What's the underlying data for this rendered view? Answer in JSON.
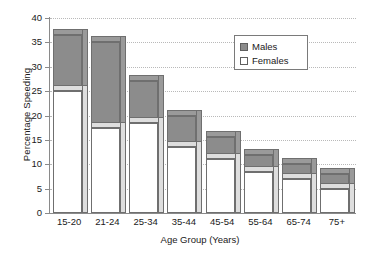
{
  "chart_data": {
    "type": "bar",
    "title": "",
    "xlabel": "Age Group (Years)",
    "ylabel": "Percentage Speeding",
    "categories": [
      "15-20",
      "21-24",
      "25-34",
      "35-44",
      "45-54",
      "55-64",
      "65-74",
      "75+"
    ],
    "series": [
      {
        "name": "Males",
        "values": [
          36.5,
          35.0,
          27.0,
          20.0,
          15.5,
          12.0,
          10.0,
          8.0
        ]
      },
      {
        "name": "Females",
        "values": [
          25.0,
          17.5,
          18.5,
          13.5,
          11.0,
          8.5,
          7.0,
          5.0
        ]
      }
    ],
    "ylim": [
      0,
      40
    ],
    "yticks": [
      0,
      5,
      10,
      15,
      20,
      25,
      30,
      35,
      40
    ],
    "ytick_labels": [
      "0",
      "5",
      "10",
      "15",
      "20",
      "25",
      "30",
      "35",
      "40"
    ],
    "grid": true,
    "legend_position": "top-right",
    "colors": {
      "males": "#8c8c8c",
      "females": "#ffffff",
      "outline": "#6f6f6f",
      "grid": "#b9b9b9",
      "axis": "#8a8a8a",
      "text": "#1a1a1a",
      "background": "#ffffff"
    },
    "style": "overlapping 3d bars, females drawn in front of males"
  },
  "legend": {
    "items": [
      {
        "label": "Males",
        "swatch": "filled-gray-square"
      },
      {
        "label": "Females",
        "swatch": "outlined-white-square"
      }
    ]
  }
}
